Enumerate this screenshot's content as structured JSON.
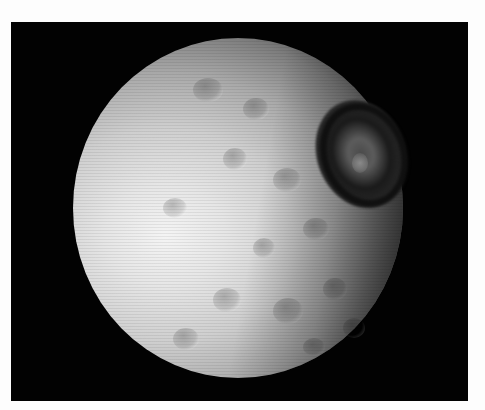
{
  "image": {
    "subject": "Cratered moon with a large crater on its upper-right limb, grayscale photo against black background",
    "colors": {
      "background": "#020202",
      "surface_bright": "#f4f4f4",
      "surface_mid": "#a9a9a9",
      "shadow": "#101010",
      "page": "#fdfdfd"
    }
  }
}
